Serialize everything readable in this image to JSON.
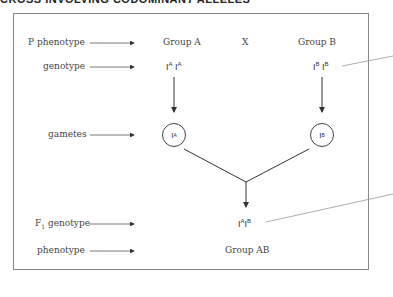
{
  "heading": "CROSS INVOLVING CODOMINANT ALLELES",
  "row_labels": {
    "p_phenotype": "P phenotype",
    "genotype": "genotype",
    "gametes": "gametes",
    "f1_genotype_main": "F",
    "f1_genotype_sub": "1",
    "f1_genotype_rest": " genotype",
    "phenotype": "phenotype"
  },
  "parents": {
    "left": {
      "phenotype": "Group A",
      "genotype": [
        {
          "base": "I",
          "sup": "A"
        },
        {
          "base": "I",
          "sup": "A"
        }
      ],
      "gamete": {
        "base": "I",
        "sup": "A"
      }
    },
    "cross_symbol": "X",
    "right": {
      "phenotype": "Group B",
      "genotype": [
        {
          "base": "I",
          "sup": "B"
        },
        {
          "base": "I",
          "sup": "B"
        }
      ],
      "gamete": {
        "base": "I",
        "sup": "B"
      }
    }
  },
  "offspring": {
    "genotype": [
      {
        "base": "I",
        "sup": "A"
      },
      {
        "base": "I",
        "sup": "B"
      }
    ],
    "phenotype": "Group AB"
  },
  "colors": {
    "border": "#888888",
    "line": "#333333",
    "callout": "#999999"
  }
}
